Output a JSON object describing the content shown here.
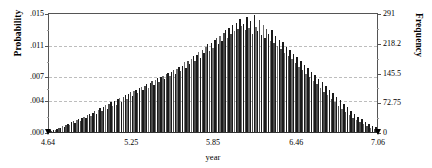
{
  "chart_data": {
    "type": "bar",
    "title": "",
    "subtitle": "",
    "xlabel": "year",
    "ylabel": "Probability",
    "y2label": "Frequency",
    "grid": true,
    "legend": null,
    "xlim": [
      4.64,
      7.06
    ],
    "ylim": [
      0.0,
      0.015
    ],
    "y2lim": [
      0,
      291
    ],
    "xticks": [
      "4.64",
      "5.25",
      "5.85",
      "6.46",
      "7.06"
    ],
    "xtick_values": [
      4.64,
      5.25,
      5.85,
      6.46,
      7.06
    ],
    "yticks": [
      ".000",
      ".004",
      ".007",
      ".011",
      ".015"
    ],
    "ytick_values": [
      0.0,
      0.004,
      0.007,
      0.011,
      0.015
    ],
    "y2ticks": [
      "0",
      "72.75",
      "145.5",
      "218.2",
      "291"
    ],
    "y2tick_values": [
      0,
      72.75,
      145.5,
      218.2,
      291
    ],
    "bin_width": 0.0132,
    "n_bins": 184,
    "x": [
      4.647,
      4.66,
      4.673,
      4.686,
      4.699,
      4.712,
      4.726,
      4.739,
      4.752,
      4.765,
      4.778,
      4.791,
      4.804,
      4.818,
      4.831,
      4.844,
      4.857,
      4.87,
      4.883,
      4.896,
      4.91,
      4.923,
      4.936,
      4.949,
      4.962,
      4.975,
      4.988,
      5.002,
      5.015,
      5.028,
      5.041,
      5.054,
      5.067,
      5.08,
      5.094,
      5.107,
      5.12,
      5.133,
      5.146,
      5.159,
      5.172,
      5.186,
      5.199,
      5.212,
      5.225,
      5.238,
      5.251,
      5.264,
      5.278,
      5.291,
      5.304,
      5.317,
      5.33,
      5.343,
      5.356,
      5.37,
      5.383,
      5.396,
      5.409,
      5.422,
      5.435,
      5.448,
      5.462,
      5.475,
      5.488,
      5.501,
      5.514,
      5.527,
      5.54,
      5.554,
      5.567,
      5.58,
      5.593,
      5.606,
      5.619,
      5.632,
      5.646,
      5.659,
      5.672,
      5.685,
      5.698,
      5.711,
      5.724,
      5.738,
      5.751,
      5.764,
      5.777,
      5.79,
      5.803,
      5.816,
      5.83,
      5.843,
      5.856,
      5.869,
      5.882,
      5.895,
      5.908,
      5.922,
      5.935,
      5.948,
      5.961,
      5.974,
      5.987,
      6.0,
      6.014,
      6.027,
      6.04,
      6.053,
      6.066,
      6.079,
      6.092,
      6.106,
      6.119,
      6.132,
      6.145,
      6.158,
      6.171,
      6.184,
      6.198,
      6.211,
      6.224,
      6.237,
      6.25,
      6.263,
      6.276,
      6.29,
      6.303,
      6.316,
      6.329,
      6.342,
      6.355,
      6.368,
      6.382,
      6.395,
      6.408,
      6.421,
      6.434,
      6.447,
      6.46,
      6.474,
      6.487,
      6.5,
      6.513,
      6.526,
      6.539,
      6.552,
      6.566,
      6.579,
      6.592,
      6.605,
      6.618,
      6.631,
      6.644,
      6.658,
      6.671,
      6.684,
      6.697,
      6.71,
      6.723,
      6.736,
      6.75,
      6.763,
      6.776,
      6.789,
      6.802,
      6.815,
      6.828,
      6.842,
      6.855,
      6.868,
      6.881,
      6.894,
      6.907,
      6.92,
      6.934,
      6.947,
      6.96,
      6.973,
      6.986,
      6.999,
      7.012,
      7.026,
      7.039,
      7.052
    ],
    "values": [
      0.00025,
      0.00018,
      0.0003,
      0.00022,
      0.00042,
      0.00055,
      0.00048,
      0.00075,
      0.00068,
      0.0009,
      0.00105,
      0.00085,
      0.0012,
      0.00135,
      0.00115,
      0.0015,
      0.00165,
      0.0014,
      0.0018,
      0.00195,
      0.00175,
      0.0021,
      0.0023,
      0.00205,
      0.00245,
      0.00265,
      0.00225,
      0.0028,
      0.003,
      0.0027,
      0.00315,
      0.0034,
      0.0029,
      0.00355,
      0.00375,
      0.0033,
      0.0039,
      0.00345,
      0.0041,
      0.0043,
      0.0038,
      0.00445,
      0.00465,
      0.0042,
      0.0048,
      0.005,
      0.00455,
      0.00515,
      0.00535,
      0.0049,
      0.0055,
      0.0057,
      0.00525,
      0.00585,
      0.00605,
      0.0056,
      0.0062,
      0.0064,
      0.00595,
      0.00655,
      0.00675,
      0.0063,
      0.0069,
      0.0071,
      0.00665,
      0.00725,
      0.00745,
      0.007,
      0.0076,
      0.0078,
      0.00735,
      0.00795,
      0.00815,
      0.0077,
      0.0083,
      0.0088,
      0.00805,
      0.009,
      0.0086,
      0.0092,
      0.00955,
      0.0089,
      0.00975,
      0.0101,
      0.00935,
      0.0104,
      0.0099,
      0.0107,
      0.01105,
      0.01025,
      0.01125,
      0.01065,
      0.01155,
      0.0119,
      0.0111,
      0.01215,
      0.01145,
      0.0125,
      0.01285,
      0.0118,
      0.0131,
      0.0123,
      0.01345,
      0.0127,
      0.0138,
      0.013,
      0.0142,
      0.0134,
      0.01365,
      0.0129,
      0.01455,
      0.0131,
      0.01395,
      0.0124,
      0.0148,
      0.0133,
      0.0127,
      0.0141,
      0.01225,
      0.01355,
      0.0118,
      0.013,
      0.0124,
      0.0115,
      0.01285,
      0.0112,
      0.0121,
      0.0109,
      0.01165,
      0.01045,
      0.0113,
      0.01,
      0.01075,
      0.0096,
      0.0103,
      0.00915,
      0.00985,
      0.0087,
      0.0094,
      0.00825,
      0.00895,
      0.0078,
      0.0085,
      0.00735,
      0.00805,
      0.0069,
      0.0076,
      0.00645,
      0.00715,
      0.006,
      0.0067,
      0.00555,
      0.00625,
      0.0051,
      0.0058,
      0.00465,
      0.00535,
      0.0042,
      0.0049,
      0.00375,
      0.00445,
      0.0033,
      0.004,
      0.0029,
      0.00355,
      0.0025,
      0.0031,
      0.00215,
      0.0027,
      0.0018,
      0.0023,
      0.0015,
      0.00195,
      0.0012,
      0.0016,
      0.00095,
      0.0013,
      0.00075,
      0.00105,
      0.00055,
      0.0008,
      0.0004,
      0.0006,
      0.00025
    ]
  },
  "axes": {
    "left": {
      "title": "Probability",
      "ticks": [
        {
          "label": ".015",
          "value": 0.015
        },
        {
          "label": ".011",
          "value": 0.011
        },
        {
          "label": ".007",
          "value": 0.007
        },
        {
          "label": ".004",
          "value": 0.004
        },
        {
          "label": ".000",
          "value": 0.0
        }
      ]
    },
    "right": {
      "title": "Frequency",
      "ticks": [
        {
          "label": "291",
          "value": 291
        },
        {
          "label": "218.2",
          "value": 218.2
        },
        {
          "label": "145.5",
          "value": 145.5
        },
        {
          "label": "72.75",
          "value": 72.75
        },
        {
          "label": "0",
          "value": 0
        }
      ]
    },
    "bottom": {
      "title": "year",
      "ticks": [
        {
          "label": "4.64",
          "value": 4.64
        },
        {
          "label": "5.25",
          "value": 5.25
        },
        {
          "label": "5.85",
          "value": 5.85
        },
        {
          "label": "6.46",
          "value": 6.46
        },
        {
          "label": "7.06",
          "value": 7.06
        }
      ]
    }
  },
  "style": {
    "bar_dark": "#1a1a1a",
    "bar_mid": "#4a4a4a",
    "bar_light": "#6e6e6e",
    "grid_color": "#bdbdbd",
    "axis_color": "#555555",
    "background": "#ffffff"
  }
}
